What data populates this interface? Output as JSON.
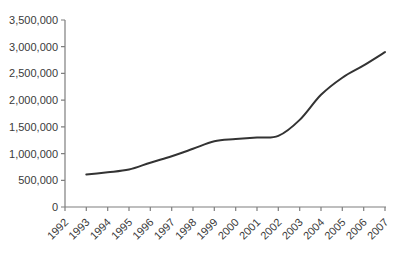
{
  "chart_data": {
    "type": "line",
    "title": "",
    "xlabel": "",
    "ylabel": "",
    "x": [
      "1992",
      "1993",
      "1994",
      "1995",
      "1996",
      "1997",
      "1998",
      "1999",
      "2000",
      "2001",
      "2002",
      "2003",
      "2004",
      "2005",
      "2006",
      "2007"
    ],
    "series": [
      {
        "name": "series-1",
        "values": [
          null,
          610000,
          650000,
          700000,
          830000,
          950000,
          1090000,
          1230000,
          1270000,
          1300000,
          1330000,
          1630000,
          2100000,
          2420000,
          2650000,
          2900000
        ]
      }
    ],
    "ylim": [
      0,
      3500000
    ],
    "ytick_step": 500000,
    "ytick_labels": [
      "0",
      "500,000",
      "1,000,000",
      "1,500,000",
      "2,000,000",
      "2,500,000",
      "3,000,000",
      "3,500,000"
    ],
    "grid": false,
    "legend": "none",
    "x_label_rotation_deg": -45,
    "colors": {
      "line": "#333333",
      "axis": "#7f7f7f",
      "tick_text": "#3a3a3a",
      "background": "#ffffff"
    }
  }
}
